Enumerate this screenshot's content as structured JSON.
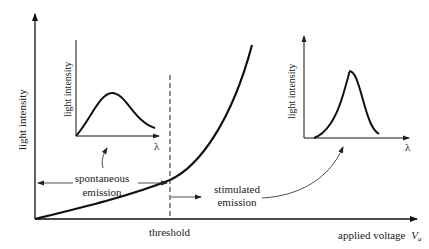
{
  "main_axes": {
    "y_label": "light intensity",
    "x_label": "applied voltage",
    "x_label_var": "V",
    "x_label_sub": "a"
  },
  "threshold": {
    "label": "threshold"
  },
  "regions": {
    "spontaneous": {
      "line1": "spontaneous",
      "line2": "emission"
    },
    "stimulated": {
      "line1": "stimulated",
      "line2": "emission"
    }
  },
  "inset_left": {
    "y_label": "light intensity",
    "x_label": "λ"
  },
  "inset_right": {
    "y_label": "light intensity",
    "x_label": "λ"
  },
  "colors": {
    "ink": "#111111",
    "text": "#222222",
    "background": "#ffffff"
  }
}
